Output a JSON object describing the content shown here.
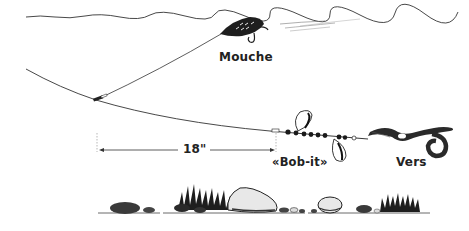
{
  "diagram": {
    "type": "fishing-rig-illustration",
    "labels": {
      "fly": "Mouche",
      "spinner": "«Bob-it»",
      "worm": "Vers",
      "distance": "18\""
    },
    "colors": {
      "ink": "#222222",
      "background": "#ffffff",
      "rock_light": "#e8e8e8",
      "rock_dark": "#3a3a3a"
    },
    "components": [
      {
        "id": "water-surface",
        "name": "Water surface line"
      },
      {
        "id": "fly",
        "name": "Fly lure at surface",
        "label": "Mouche"
      },
      {
        "id": "main-line",
        "name": "Main fishing line"
      },
      {
        "id": "dropper-line",
        "name": "Dropper line to fly"
      },
      {
        "id": "swivel",
        "name": "Line junction swivel"
      },
      {
        "id": "distance-marker",
        "name": "Distance arrow",
        "label": "18\""
      },
      {
        "id": "spinner-rig",
        "name": "Spinner with beads and blades",
        "label": "«Bob-it»"
      },
      {
        "id": "worm",
        "name": "Worm bait",
        "label": "Vers"
      },
      {
        "id": "bottom",
        "name": "Lake bottom with rocks and weeds"
      }
    ]
  }
}
